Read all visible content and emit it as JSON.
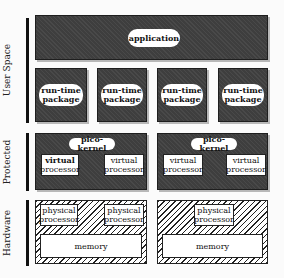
{
  "layers": {
    "user_space": "User Space",
    "protected": "Protected",
    "hardware": "Hardware"
  },
  "user_space": {
    "application": "application",
    "packages": [
      {
        "line1": "run-time",
        "line2": "package"
      },
      {
        "line1": "run-time",
        "line2": "package"
      },
      {
        "line1": "run-time",
        "line2": "package"
      },
      {
        "line1": "run-time",
        "line2": "package"
      }
    ]
  },
  "protected": {
    "kernels": [
      {
        "title": "pico-kernel",
        "vps": [
          {
            "line1": "virtual",
            "line2": "processor"
          },
          {
            "line1": "virtual",
            "line2": "processor"
          }
        ]
      },
      {
        "title": "pico-kernel",
        "vps": [
          {
            "line1": "virtual",
            "line2": "processor"
          },
          {
            "line1": "virtual",
            "line2": "processor"
          }
        ]
      }
    ]
  },
  "hardware": {
    "nodes": [
      {
        "processors": [
          {
            "line1": "physical",
            "line2": "processor"
          },
          {
            "line1": "physical",
            "line2": "processor"
          }
        ],
        "memory": "memory"
      },
      {
        "processors": [
          {
            "line1": "physical",
            "line2": "processor"
          }
        ],
        "memory": "memory"
      }
    ]
  }
}
